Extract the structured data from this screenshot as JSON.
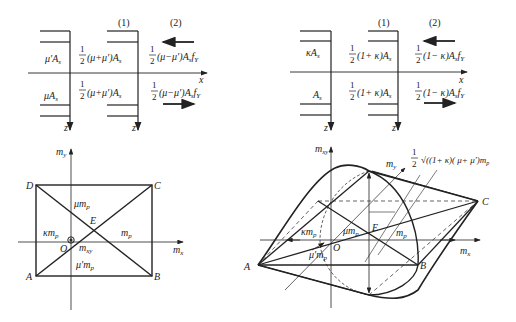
{
  "top_left": {
    "col1_label": "(1)",
    "col2_label": "(2)",
    "upper_steel": "μ′A",
    "upper_steel_sub": "s",
    "lower_steel": "μA",
    "lower_steel_sub": "s",
    "col1_upper_frac": "1/2",
    "col1_upper": "(μ+μ′)A",
    "col1_upper_sub": "s",
    "col1_lower": "(μ+μ′)A",
    "col1_lower_sub": "s",
    "col2_upper": "(μ−μ′)A",
    "col2_upper_tail": "f",
    "col2_upper_sub1": "s",
    "col2_upper_sub2": "Y",
    "col2_lower": "(μ−μ′)A",
    "col2_lower_tail": "f",
    "col2_lower_sub1": "s",
    "col2_lower_sub2": "Y",
    "x_axis": "x",
    "z_axis": "z",
    "half": "1",
    "two": "2"
  },
  "top_right": {
    "col1_label": "(1)",
    "col2_label": "(2)",
    "upper_steel": "κA",
    "upper_steel_sub": "s",
    "lower_steel": "A",
    "lower_steel_sub": "s",
    "col1_upper": "(1+ κ)A",
    "col1_upper_sub": "s",
    "col1_lower": "(1+ κ)A",
    "col1_lower_sub": "s",
    "col2_upper": "(1− κ)A",
    "col2_upper_tail": "f",
    "col2_upper_sub1": "s",
    "col2_upper_sub2": "Y",
    "col2_lower": "(1− κ)A",
    "col2_lower_tail": "f",
    "col2_lower_sub1": "s",
    "col2_lower_sub2": "Y",
    "x_axis": "x",
    "z_axis": "z",
    "half": "1",
    "two": "2"
  },
  "bottom_left": {
    "y_axis": "m",
    "y_axis_sub": "y",
    "x_axis": "m",
    "x_axis_sub": "x",
    "point_A": "A",
    "point_B": "B",
    "point_C": "C",
    "point_D": "D",
    "point_E": "E",
    "origin": "O",
    "top_label": "μm",
    "top_label_sub": "p",
    "left_label": "κm",
    "left_label_sub": "p",
    "right_label": "m",
    "right_label_sub": "p",
    "bottom_label": "μ′m",
    "bottom_label_sub": "p",
    "mxy_label": "m",
    "mxy_label_sub": "xy"
  },
  "bottom_right": {
    "vertical_axis": "m",
    "vertical_axis_sub": "xy",
    "y_axis": "m",
    "y_axis_sub": "y",
    "x_axis": "m",
    "x_axis_sub": "x",
    "point_A": "A",
    "point_B": "B",
    "point_C": "C",
    "point_E": "E",
    "origin": "O",
    "height_formula_frac_num": "1",
    "height_formula_frac_den": "2",
    "height_formula": "√((1+ κ)( μ+ μ′)m",
    "height_formula_sub": "p",
    "left_label": "κm",
    "left_label_sub": "p",
    "center_label": "μm",
    "center_label_sub": "p",
    "right_label": "m",
    "right_label_sub": "p",
    "bottom_label": "μ′m",
    "bottom_label_sub": "p"
  }
}
